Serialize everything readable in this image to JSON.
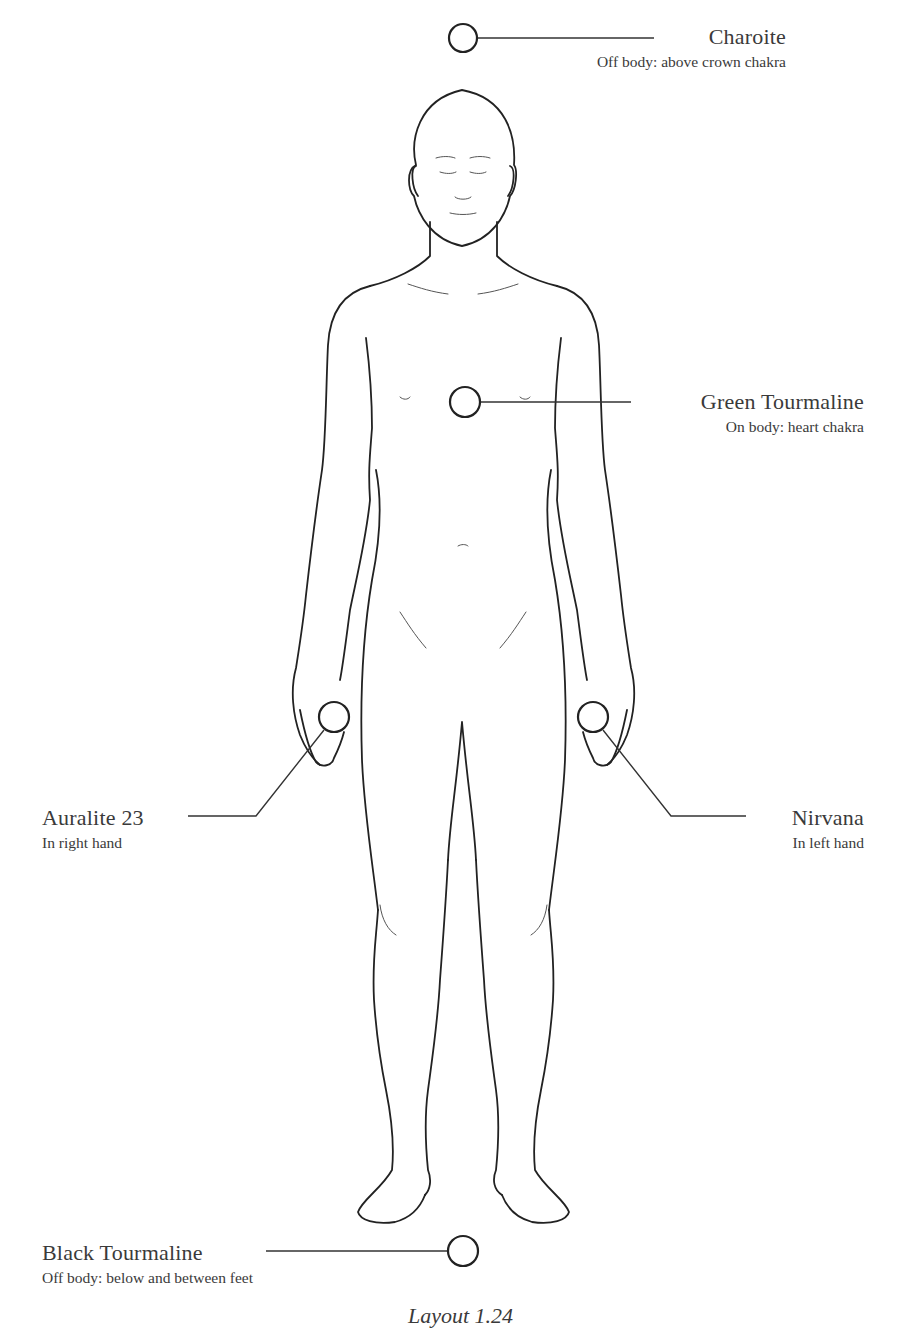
{
  "diagram": {
    "type": "crystal-placement-body-map",
    "figure": "front-view human body line drawing",
    "colors": {
      "line": "#222222",
      "text": "#3a3a3a",
      "background": "#ffffff"
    },
    "placements": [
      {
        "id": "charoite",
        "name": "Charoite",
        "placement": "Off body: above crown chakra",
        "marker": {
          "cx": 463,
          "cy": 38,
          "r": 14
        }
      },
      {
        "id": "green-tourmaline",
        "name": "Green Tourmaline",
        "placement": "On body: heart chakra",
        "marker": {
          "cx": 465,
          "cy": 402,
          "r": 15
        }
      },
      {
        "id": "auralite-23",
        "name": "Auralite 23",
        "placement": "In right hand",
        "marker": {
          "cx": 334,
          "cy": 717,
          "r": 15
        }
      },
      {
        "id": "nirvana",
        "name": "Nirvana",
        "placement": "In left hand",
        "marker": {
          "cx": 593,
          "cy": 717,
          "r": 15
        }
      },
      {
        "id": "black-tourmaline",
        "name": "Black Tourmaline",
        "placement": "Off body: below and between feet",
        "marker": {
          "cx": 463,
          "cy": 1251,
          "r": 15
        }
      }
    ],
    "caption": "Layout 1.24"
  }
}
